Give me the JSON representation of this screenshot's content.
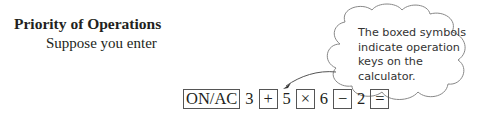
{
  "heading": "Priority of Operations",
  "subtext": "Suppose you enter",
  "callout": {
    "text": "The boxed symbols indicate operation keys on the calculator."
  },
  "sequence": [
    {
      "type": "key",
      "label": "ON/AC"
    },
    {
      "type": "number",
      "label": "3"
    },
    {
      "type": "key",
      "label": "+"
    },
    {
      "type": "number",
      "label": "5"
    },
    {
      "type": "key",
      "label": "×"
    },
    {
      "type": "number",
      "label": "6"
    },
    {
      "type": "key",
      "label": "−"
    },
    {
      "type": "number",
      "label": "2"
    },
    {
      "type": "key",
      "label": "="
    }
  ]
}
